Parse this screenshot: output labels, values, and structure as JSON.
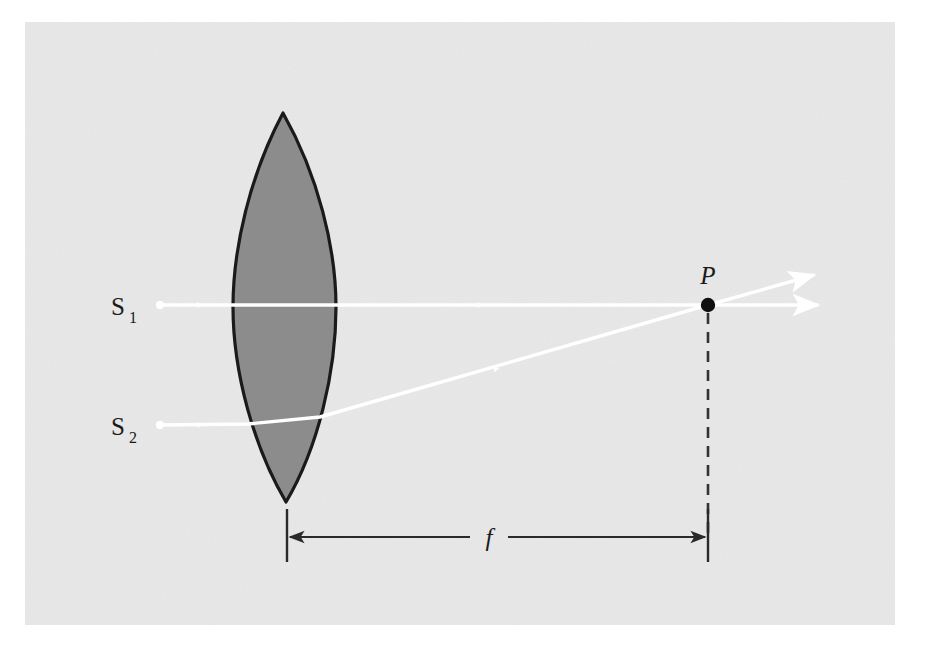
{
  "figure": {
    "kind": "optics-ray-diagram",
    "caption_visible": false,
    "panel": {
      "background_color": "#e8e8e8",
      "page_color": "#ffffff",
      "x": 25,
      "y": 22,
      "width": 870,
      "height": 603
    },
    "lens": {
      "name": "converging-biconvex-lens",
      "fill_color": "#8c8c8c",
      "outline_color": "#1a1a1a",
      "top_tip_x": 283,
      "top_tip_y": 113,
      "bottom_tip_x": 286,
      "bottom_tip_y": 502,
      "left_edge_x": 233,
      "right_edge_x": 336,
      "center_y": 307
    },
    "labels": {
      "source_1": {
        "text": "S",
        "subscript": "1",
        "x": 118,
        "y": 315
      },
      "source_2": {
        "text": "S",
        "subscript": "2",
        "x": 118,
        "y": 435
      },
      "focal_point": {
        "text": "P",
        "x": 700,
        "y": 282
      },
      "focal_length": {
        "text": "f",
        "x": 488,
        "y": 546
      }
    },
    "rays": {
      "color": "#ffffff",
      "ray_1": {
        "name": "axial-ray-S1",
        "start_x": 160,
        "start_y": 305,
        "end_x": 708,
        "end_y": 305,
        "arrow_x": 478,
        "arrow_y": 305
      },
      "ray_2": {
        "name": "off-axis-ray-S2",
        "start_x": 160,
        "start_y": 425,
        "lens_entry_x": 248,
        "lens_entry_y": 424,
        "lens_exit_x": 320,
        "lens_exit_y": 417,
        "end_x": 708,
        "end_y": 305,
        "arrow_in_x": 198,
        "arrow_in_y": 425,
        "arrow_out_x": 492,
        "arrow_out_y": 372
      },
      "outgoing_horizontal": {
        "name": "outgoing-ray-horizontal",
        "start_x": 708,
        "start_y": 305,
        "end_x": 824,
        "end_y": 305
      },
      "outgoing_upward": {
        "name": "outgoing-ray-upward",
        "start_x": 708,
        "start_y": 305,
        "end_x": 820,
        "end_y": 274
      }
    },
    "focal_point_marker": {
      "x": 708,
      "y": 305,
      "radius": 7,
      "color": "#111111"
    },
    "dashed_drop_line": {
      "x": 708,
      "y_top": 312,
      "y_bottom": 537,
      "color": "#333333"
    },
    "dimension_line": {
      "name": "focal-length-dimension",
      "y": 537,
      "left_x": 287,
      "right_x": 708,
      "tick_top_y": 508,
      "tick_bottom_y": 562,
      "gap_left_x": 470,
      "gap_right_x": 508,
      "color": "#2a2a2a"
    }
  }
}
